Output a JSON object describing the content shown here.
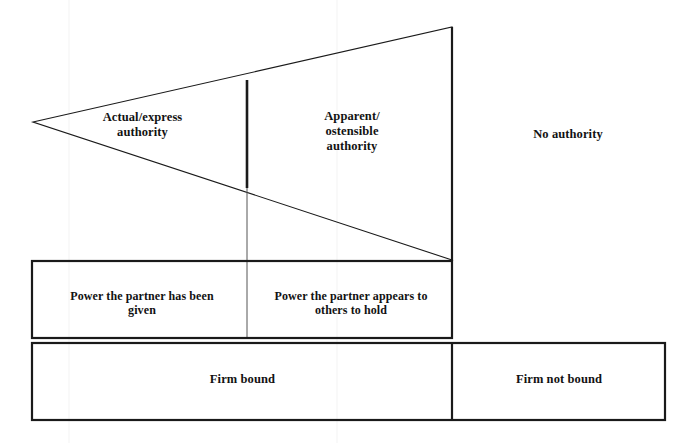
{
  "diagram": {
    "background_color": "#ffffff",
    "line_color": "#1a1a1a",
    "text_color": "#121212",
    "triangle": {
      "apex": [
        33,
        122
      ],
      "top_right": [
        452,
        27
      ],
      "bottom_right": [
        452,
        260
      ],
      "internal_divider_x": 247
    },
    "labels": {
      "actual_express_authority": "Actual/express\nauthority",
      "apparent_ostensible_authority": "Apparent/\nostensible\nauthority",
      "no_authority": "No authority",
      "power_given": "Power the partner has been\ngiven",
      "power_appears": "Power the partner appears to\nothers to hold",
      "firm_bound": "Firm bound",
      "firm_not_bound": "Firm not bound"
    },
    "middle_row": {
      "x": 32,
      "y": 261,
      "width": 420,
      "height": 77,
      "divider_x": 247
    },
    "bottom_row": {
      "x": 32,
      "y": 343,
      "width": 633,
      "height": 77,
      "divider_x": 452
    }
  }
}
